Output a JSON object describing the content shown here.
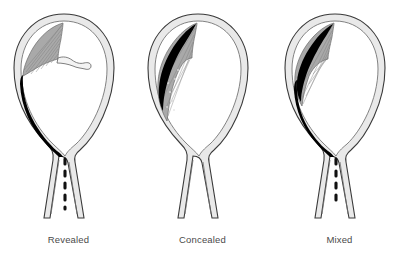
{
  "figure": {
    "background_color": "#ffffff",
    "panel_count": 3,
    "colors": {
      "outline": "#3a3a3a",
      "uterine_wall_fill": "#e8e8e8",
      "placenta_fill": "#a8a8a8",
      "placenta_stripe": "#7d7d7d",
      "hematoma_blood": "#000000",
      "cord_fill": "#f2f2f2",
      "label_text": "#4a4a4a",
      "cavity_fill": "#ffffff"
    },
    "panels": [
      {
        "id": "revealed",
        "label": "Revealed",
        "blood_escapes_through_cervix": true,
        "has_dashed_blood_trail": true,
        "retroplacental_clot": false,
        "blood_streak_down_wall": true,
        "description": "Blood tracks down the uterine wall and drains out through the cervix"
      },
      {
        "id": "concealed",
        "label": "Concealed",
        "blood_escapes_through_cervix": false,
        "has_dashed_blood_trail": false,
        "retroplacental_clot": true,
        "blood_streak_down_wall": false,
        "description": "Blood is trapped behind the placenta and does not escape"
      },
      {
        "id": "mixed",
        "label": "Mixed",
        "blood_escapes_through_cervix": true,
        "has_dashed_blood_trail": true,
        "retroplacental_clot": true,
        "blood_streak_down_wall": true,
        "description": "Blood collects behind the placenta and also drains through the cervix"
      }
    ],
    "anatomy_parts": [
      "uterine-wall",
      "amniotic-cavity",
      "placenta",
      "umbilical-cord-stub",
      "cervical-canal",
      "hematoma"
    ]
  }
}
